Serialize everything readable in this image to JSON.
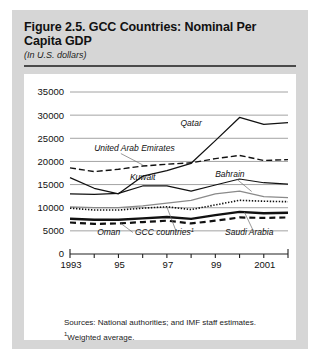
{
  "figure": {
    "title": "Figure 2.5. GCC Countries: Nominal Per Capita GDP",
    "subtitle": "(In U.S. dollars)",
    "sources_line1": "Sources: National authorities; and IMF staff estimates.",
    "sources_line2_sup": "1",
    "sources_line2": "Weighted average."
  },
  "chart_data": {
    "type": "line",
    "title": "GCC Countries: Nominal Per Capita GDP",
    "subtitle": "(In U.S. dollars)",
    "xlabel": "",
    "ylabel": "",
    "xlim": [
      1993,
      2002
    ],
    "ylim": [
      0,
      35000
    ],
    "ytick_values": [
      0,
      5000,
      10000,
      15000,
      20000,
      25000,
      30000,
      35000
    ],
    "ytick_labels": [
      "0",
      "5000",
      "10000",
      "15000",
      "20000",
      "25000",
      "30000",
      "35000"
    ],
    "xtick_values": [
      1993,
      1994,
      1995,
      1996,
      1997,
      1998,
      1999,
      2000,
      2001,
      2002
    ],
    "xtick_labels": [
      "1993",
      "",
      "95",
      "",
      "97",
      "",
      "99",
      "",
      "2001",
      ""
    ],
    "grid": "horizontal",
    "legend": "inline-annotations",
    "x": [
      1993,
      1994,
      1995,
      1996,
      1997,
      1998,
      1999,
      2000,
      2001,
      2002
    ],
    "series": [
      {
        "name": "Qatar",
        "style": "solid-thin-black",
        "label_x": 1998.0,
        "label_y": 27600,
        "values": [
          16500,
          14200,
          13000,
          16800,
          18000,
          19600,
          24500,
          29500,
          28000,
          28400
        ]
      },
      {
        "name": "United Arab Emirates",
        "style": "dashed-black",
        "label_x": 1994.0,
        "label_y": 22300,
        "values": [
          18600,
          17800,
          18300,
          19000,
          19400,
          19700,
          20600,
          21300,
          20200,
          20400
        ]
      },
      {
        "name": "Kuwait",
        "style": "solid-black",
        "label_x": 1996.0,
        "label_y": 15900,
        "values": [
          13000,
          12900,
          13100,
          14700,
          14700,
          13600,
          14900,
          16200,
          15400,
          15100
        ]
      },
      {
        "name": "Bahrain",
        "style": "solid-gray",
        "label_x": 1999.6,
        "label_y": 16600,
        "values": [
          10200,
          10000,
          10000,
          10400,
          11000,
          11600,
          13000,
          13600,
          12400,
          12200
        ]
      },
      {
        "name": "GCC countries",
        "name_footnote": "1",
        "style": "dotted-black",
        "label_x": 1996.9,
        "label_y": 4200,
        "values": [
          9900,
          9500,
          9500,
          9900,
          10200,
          9600,
          10600,
          11600,
          11400,
          11300
        ]
      },
      {
        "name": "Saudi Arabia",
        "style": "solid-thick-black",
        "label_x": 2000.4,
        "label_y": 4200,
        "values": [
          7600,
          7400,
          7400,
          7700,
          8000,
          7600,
          8400,
          9100,
          8800,
          8900
        ]
      },
      {
        "name": "Oman",
        "style": "dashed-thick-black",
        "label_x": 1994.6,
        "label_y": 4200,
        "values": [
          6800,
          6500,
          6600,
          6900,
          7200,
          6600,
          7200,
          7900,
          7800,
          7900
        ]
      }
    ],
    "annotations": [
      {
        "text": "Qatar",
        "for": "Qatar"
      },
      {
        "text": "United Arab Emirates",
        "for": "United Arab Emirates"
      },
      {
        "text": "Kuwait",
        "for": "Kuwait"
      },
      {
        "text": "Bahrain",
        "for": "Bahrain"
      },
      {
        "text": "GCC countries¹",
        "for": "GCC countries"
      },
      {
        "text": "Saudi Arabia",
        "for": "Saudi Arabia"
      },
      {
        "text": "Oman",
        "for": "Oman"
      }
    ],
    "colors": {
      "background": "#ffffff",
      "card": "#d6d6d6",
      "axis": "#222222",
      "grid": "#8c8c8c",
      "series_black": "#111111",
      "series_gray": "#8a8a8a"
    }
  }
}
